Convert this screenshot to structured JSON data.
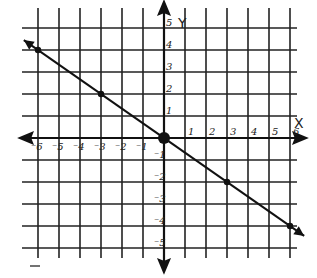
{
  "chart_data": {
    "type": "line",
    "title": "",
    "xlabel": "X",
    "ylabel": "Y",
    "xlim": [
      -6,
      6
    ],
    "ylim": [
      -5,
      5
    ],
    "grid": true,
    "x_ticks": [
      "-6",
      "-5",
      "-4",
      "-3",
      "-2",
      "-1",
      "1",
      "2",
      "3",
      "4",
      "5",
      "6"
    ],
    "y_ticks": [
      "5",
      "4",
      "3",
      "2",
      "1",
      "-1",
      "-2",
      "-3",
      "-4",
      "-5"
    ],
    "series": [
      {
        "name": "line",
        "equation": "y = -2/3 x",
        "points": [
          [
            -6,
            4
          ],
          [
            -3,
            2
          ],
          [
            0,
            0
          ],
          [
            3,
            -2
          ],
          [
            6,
            -4
          ]
        ]
      }
    ]
  },
  "labels": {
    "x_axis": "X",
    "y_axis": "Y"
  },
  "colors": {
    "ink": "#1a1a1a",
    "paper": "#ffffff"
  }
}
